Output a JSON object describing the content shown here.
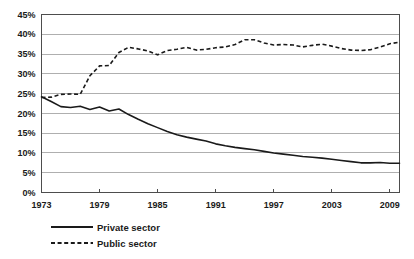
{
  "chart_data": {
    "type": "line",
    "title": "",
    "subtitle": "",
    "xlabel": "",
    "ylabel": "",
    "xlim": [
      1973,
      2010
    ],
    "ylim": [
      0,
      45
    ],
    "grid": true,
    "grid_axis": "y",
    "legend_position": "bottom-left",
    "y_tick_labels": [
      "45%",
      "40%",
      "35%",
      "30%",
      "25%",
      "20%",
      "15%",
      "10%",
      "5%",
      "0%"
    ],
    "y_tick_values": [
      45,
      40,
      35,
      30,
      25,
      20,
      15,
      10,
      5,
      0
    ],
    "x_tick_labels": [
      "1973",
      "1979",
      "1985",
      "1991",
      "1997",
      "2003",
      "2009"
    ],
    "x_tick_values": [
      1973,
      1979,
      1985,
      1991,
      1997,
      2003,
      2009
    ],
    "x": [
      1973,
      1974,
      1975,
      1976,
      1977,
      1978,
      1979,
      1980,
      1981,
      1982,
      1983,
      1984,
      1985,
      1986,
      1987,
      1988,
      1989,
      1990,
      1991,
      1992,
      1993,
      1994,
      1995,
      1996,
      1997,
      1998,
      1999,
      2000,
      2001,
      2002,
      2003,
      2004,
      2005,
      2006,
      2007,
      2008,
      2009,
      2010
    ],
    "series": [
      {
        "name": "Private sector",
        "style": "solid",
        "color": "#1a1a1a",
        "values": [
          24.2,
          23.0,
          21.7,
          21.5,
          21.8,
          21.0,
          21.6,
          20.6,
          21.1,
          19.7,
          18.5,
          17.4,
          16.4,
          15.4,
          14.6,
          14.0,
          13.5,
          13.0,
          12.3,
          11.8,
          11.4,
          11.1,
          10.8,
          10.4,
          10.0,
          9.7,
          9.4,
          9.1,
          8.9,
          8.7,
          8.4,
          8.1,
          7.8,
          7.5,
          7.5,
          7.6,
          7.4,
          7.4
        ]
      },
      {
        "name": "Public sector",
        "style": "dashed",
        "color": "#1a1a1a",
        "values": [
          24.0,
          24.1,
          24.8,
          24.9,
          24.8,
          29.5,
          32.0,
          32.1,
          35.4,
          36.7,
          36.3,
          35.8,
          34.8,
          35.9,
          36.2,
          36.7,
          36.0,
          36.2,
          36.6,
          36.8,
          37.4,
          38.6,
          38.6,
          37.8,
          37.3,
          37.4,
          37.3,
          36.8,
          37.2,
          37.5,
          37.0,
          36.4,
          36.0,
          35.9,
          36.1,
          36.8,
          37.6,
          38.0
        ]
      }
    ]
  },
  "legend": {
    "items": [
      {
        "label": "Private sector",
        "style": "solid"
      },
      {
        "label": "Public sector",
        "style": "dashed"
      }
    ]
  }
}
